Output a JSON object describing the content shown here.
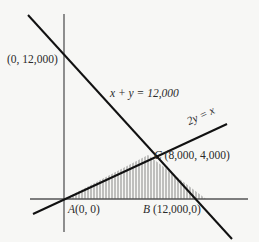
{
  "diagram": {
    "lines": [
      {
        "id": "x-plus-y",
        "equation": "x + y = 12,000"
      },
      {
        "id": "two-y-eq-x",
        "equation": "2y = x"
      }
    ],
    "points": [
      {
        "id": "y-intercept",
        "label": "(0, 12,000)"
      },
      {
        "id": "A",
        "letter": "A",
        "coords": "(0, 0)"
      },
      {
        "id": "B",
        "letter": "B",
        "coords": "(12,000,0)"
      },
      {
        "id": "C",
        "letter": "C",
        "coords": "(8,000, 4,000)"
      }
    ],
    "shaded_region": "triangle ABC",
    "colors": {
      "background": "#f7f7f5",
      "axis": "#555555",
      "line": "#111111",
      "hatch": "#444444"
    }
  }
}
